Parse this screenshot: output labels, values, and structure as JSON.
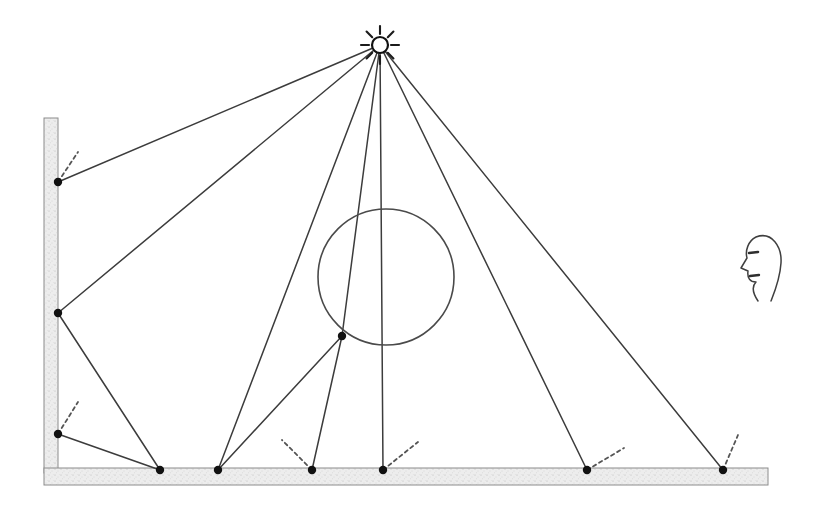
{
  "diagram": {
    "type": "ray-optics-schematic",
    "canvas": {
      "width": 818,
      "height": 507
    },
    "colors": {
      "ray_stroke": "#3c3c3c",
      "normal_stroke": "#555555",
      "surface_fill": "#ededed",
      "surface_stroke": "#8c8c8c",
      "point_fill": "#111111",
      "sphere_stroke": "#4a4a4a",
      "background": "#ffffff"
    },
    "light_source": {
      "name": "point-light",
      "label": "",
      "x": 380,
      "y": 45,
      "radius": 8,
      "burst_ray_count": 8,
      "burst_inner": 11,
      "burst_outer": 19
    },
    "eye": {
      "name": "observer-head-profile",
      "label": "",
      "x": 762,
      "y": 265,
      "facing": "left"
    },
    "sphere": {
      "name": "sphere-object",
      "label": "",
      "cx": 386,
      "cy": 277,
      "r": 68
    },
    "surfaces": [
      {
        "name": "vertical-wall",
        "x": 44,
        "y": 118,
        "width": 14,
        "height": 355
      },
      {
        "name": "horizontal-floor",
        "x": 44,
        "y": 468,
        "width": 724,
        "height": 17
      }
    ],
    "hit_points": [
      {
        "name": "wall-hit-upper",
        "x": 58,
        "y": 182,
        "normal_dx": 20,
        "normal_dy": -30
      },
      {
        "name": "wall-hit-middle",
        "x": 58,
        "y": 313,
        "normal_dx": 0,
        "normal_dy": 0
      },
      {
        "name": "wall-hit-lower",
        "x": 58,
        "y": 434,
        "normal_dx": 20,
        "normal_dy": -32
      },
      {
        "name": "floor-hit-1",
        "x": 160,
        "y": 470,
        "normal_dx": 0,
        "normal_dy": 0
      },
      {
        "name": "floor-hit-2",
        "x": 218,
        "y": 470,
        "normal_dx": 0,
        "normal_dy": 0
      },
      {
        "name": "floor-hit-3",
        "x": 312,
        "y": 470,
        "normal_dx": -30,
        "normal_dy": -30
      },
      {
        "name": "floor-hit-4",
        "x": 383,
        "y": 470,
        "normal_dx": 35,
        "normal_dy": -28
      },
      {
        "name": "floor-hit-5",
        "x": 587,
        "y": 470,
        "normal_dx": 37,
        "normal_dy": -22
      },
      {
        "name": "floor-hit-6",
        "x": 723,
        "y": 470,
        "normal_dx": 15,
        "normal_dy": -35
      },
      {
        "name": "sphere-hit-1",
        "x": 342,
        "y": 336,
        "normal_dx": 0,
        "normal_dy": 0
      }
    ],
    "rays": [
      {
        "name": "ray-light-to-wall-upper",
        "x1": 380,
        "y1": 45,
        "x2": 58,
        "y2": 182
      },
      {
        "name": "ray-light-to-wall-middle",
        "x1": 380,
        "y1": 45,
        "x2": 58,
        "y2": 313
      },
      {
        "name": "ray-light-to-floor-2",
        "x1": 380,
        "y1": 45,
        "x2": 218,
        "y2": 470
      },
      {
        "name": "ray-light-to-sphere",
        "x1": 380,
        "y1": 45,
        "x2": 342,
        "y2": 336
      },
      {
        "name": "ray-light-to-floor-4",
        "x1": 380,
        "y1": 45,
        "x2": 383,
        "y2": 470
      },
      {
        "name": "ray-light-to-floor-5",
        "x1": 380,
        "y1": 45,
        "x2": 587,
        "y2": 470
      },
      {
        "name": "ray-light-to-floor-6",
        "x1": 380,
        "y1": 45,
        "x2": 723,
        "y2": 470
      },
      {
        "name": "ray-wall-middle-to-floor-1",
        "x1": 58,
        "y1": 313,
        "x2": 160,
        "y2": 470
      },
      {
        "name": "ray-wall-lower-to-floor-1",
        "x1": 58,
        "y1": 434,
        "x2": 160,
        "y2": 470
      },
      {
        "name": "ray-sphere-to-floor-3",
        "x1": 342,
        "y1": 336,
        "x2": 312,
        "y2": 470
      },
      {
        "name": "ray-sphere-to-floor-2",
        "x1": 342,
        "y1": 336,
        "x2": 218,
        "y2": 470
      }
    ]
  }
}
